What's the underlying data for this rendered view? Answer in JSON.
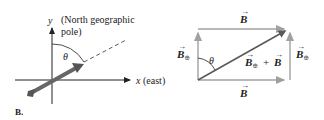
{
  "figure": {
    "label": "B.",
    "left_panel": {
      "y_axis_label": "y",
      "y_axis_note_line1": "(North geographic",
      "y_axis_note_line2": "pole)",
      "x_axis_label": "x",
      "x_axis_note": "(east)",
      "angle_label": "θ"
    },
    "right_panel": {
      "top_vector": "B",
      "bottom_vector": "B",
      "left_vector": "B",
      "left_vector_sub": "⊕",
      "right_vector": "B",
      "right_vector_sub": "⊕",
      "resultant_a": "B",
      "resultant_a_sub": "⊕",
      "resultant_plus": "+",
      "resultant_b": "B",
      "angle_label": "θ",
      "vector_arrow": "→"
    },
    "colors": {
      "axis": "#222222",
      "vector_light": "#9a9a9a",
      "vector_dark": "#5a5a5a",
      "arrow_thick": "#6a6a6a"
    }
  }
}
